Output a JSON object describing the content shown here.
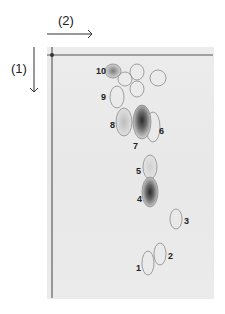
{
  "diagram": {
    "type": "two-dimensional chromatogram",
    "directions": {
      "first": {
        "label": "(1)",
        "orientation": "down"
      },
      "second": {
        "label": "(2)",
        "orientation": "right"
      }
    },
    "spots": [
      {
        "id": "1",
        "label": "1",
        "intensity": "faint"
      },
      {
        "id": "2",
        "label": "2",
        "intensity": "faint"
      },
      {
        "id": "3",
        "label": "3",
        "intensity": "faint"
      },
      {
        "id": "4",
        "label": "4",
        "intensity": "strong"
      },
      {
        "id": "5",
        "label": "5",
        "intensity": "faint"
      },
      {
        "id": "6",
        "label": "6",
        "intensity": "faint"
      },
      {
        "id": "7",
        "label": "7",
        "intensity": "strong"
      },
      {
        "id": "8",
        "label": "8",
        "intensity": "light"
      },
      {
        "id": "9",
        "label": "9",
        "intensity": "faint"
      },
      {
        "id": "10",
        "label": "10",
        "intensity": "medium"
      }
    ],
    "unlabeled_spot_count": 4,
    "colors": {
      "plate": "#e9e9e9",
      "outline": "#8a8a8a",
      "dark_spot": "#3a3a3a",
      "text": "#222222"
    }
  }
}
